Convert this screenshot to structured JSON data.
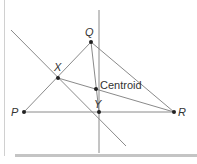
{
  "diagram": {
    "type": "geometry",
    "colors": {
      "line": "#8a8a8a",
      "point": "#222222",
      "text": "#333333",
      "border": "#d0d0d0",
      "bottom_bar": "#bdbdbd"
    },
    "points": {
      "P": {
        "label": "P",
        "x": 24,
        "y": 112
      },
      "Q": {
        "label": "Q",
        "x": 91,
        "y": 42
      },
      "R": {
        "label": "R",
        "x": 174,
        "y": 112
      },
      "X": {
        "label": "X",
        "x": 58,
        "y": 78
      },
      "Y": {
        "label": "Y",
        "x": 99,
        "y": 112
      },
      "Centroid": {
        "label": "Centroid",
        "x": 96,
        "y": 89
      }
    },
    "segments": [
      {
        "from": "P",
        "to": "Q"
      },
      {
        "from": "Q",
        "to": "R"
      },
      {
        "from": "P",
        "to": "R"
      },
      {
        "from": "X",
        "to": "R"
      },
      {
        "from": "Q",
        "to": "Y"
      }
    ],
    "lines": [
      {
        "name": "vertical-line",
        "x1": 99,
        "y1": 10,
        "x2": 99,
        "y2": 153
      },
      {
        "name": "diagonal-line",
        "x1": 11,
        "y1": 30,
        "x2": 126,
        "y2": 146
      }
    ]
  }
}
